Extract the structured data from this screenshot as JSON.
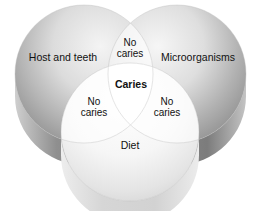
{
  "diagram": {
    "type": "venn-3-set",
    "title": "",
    "background_color": "#ffffff",
    "sets": [
      {
        "id": "host",
        "label": "Host and teeth",
        "position": "top-left",
        "fill_light": "#f2f2f2",
        "fill_dark": "#8e8e8e",
        "side_color": "#9a9a9a"
      },
      {
        "id": "microorganisms",
        "label": "Microorganisms",
        "position": "top-right",
        "fill_light": "#f4f4f4",
        "fill_dark": "#8a8a8a",
        "side_color": "#979797"
      },
      {
        "id": "diet",
        "label": "Diet",
        "position": "bottom-center",
        "fill_light": "#ffffff",
        "fill_dark": "#d8d8d8",
        "side_color": "#dcdcdc"
      }
    ],
    "intersections": [
      {
        "id": "host-microorganisms",
        "label_line1": "No",
        "label_line2": "caries",
        "position": "top-center"
      },
      {
        "id": "host-diet",
        "label_line1": "No",
        "label_line2": "caries",
        "position": "lower-left"
      },
      {
        "id": "microorganisms-diet",
        "label_line1": "No",
        "label_line2": "caries",
        "position": "lower-right"
      }
    ],
    "center": {
      "id": "host-microorganisms-diet",
      "label": "Caries",
      "bold": true,
      "fill": "#ffffff"
    }
  }
}
